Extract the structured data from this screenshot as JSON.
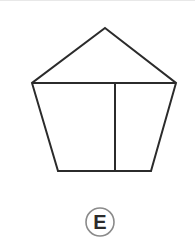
{
  "page": {
    "background_color": "#ffffff",
    "width": 195,
    "height": 247
  },
  "figure": {
    "name": "partitioned-pentagon-house-shape",
    "stroke_color": "#2b2b2b",
    "fill_color": "#ffffff",
    "stroke_width": 2,
    "vertices": {
      "apex": [
        105,
        27
      ],
      "left_shoulder": [
        32,
        82
      ],
      "right_shoulder": [
        176,
        82
      ],
      "bottom_left": [
        58,
        170
      ],
      "bottom_right": [
        151,
        170
      ]
    },
    "outline_path": "M105,27 L176,82 L151,170 L58,170 L32,82 Z",
    "internal_lines": [
      {
        "name": "roof-base-horizontal-line",
        "from": [
          32,
          82
        ],
        "to": [
          176,
          82
        ]
      },
      {
        "name": "body-vertical-divider-line",
        "from": [
          115,
          82
        ],
        "to": [
          115,
          170
        ]
      }
    ]
  },
  "answer_badge": {
    "letter": "E",
    "center": [
      100,
      221
    ],
    "radius": 14,
    "circle_color": "#8a8a8a",
    "letter_color": "#2b2b2b",
    "font_size": 20
  }
}
